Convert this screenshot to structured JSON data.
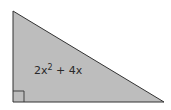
{
  "diagram": {
    "shape": "right triangle",
    "fill_color": "#bdbdbd",
    "stroke_color": "#333333",
    "vertices": [
      [
        13,
        11
      ],
      [
        13,
        102
      ],
      [
        164,
        102
      ]
    ],
    "right_angle_marker": true,
    "label": {
      "coefficient": "2x",
      "exponent": "2",
      "rest": " + 4x",
      "full": "2x² + 4x"
    }
  }
}
